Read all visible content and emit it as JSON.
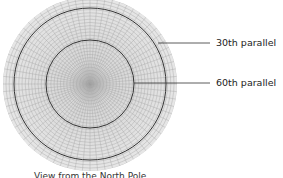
{
  "diagram": {
    "labels": [
      {
        "text": "30th parallel"
      },
      {
        "text": "60th parallel"
      }
    ],
    "caption": "View from the North Pole",
    "colors": {
      "grid": "#9a9a9a",
      "fill": "#e4e4e4",
      "parallel": "#333333"
    }
  }
}
